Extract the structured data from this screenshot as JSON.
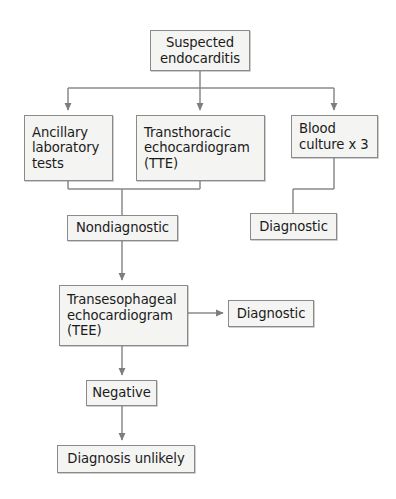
{
  "diagram": {
    "type": "flowchart",
    "background_color": "#ffffff",
    "node_fill_color": "#f4f4f2",
    "node_border_color": "#8a8a8a",
    "connector_color": "#8a8a8a",
    "text_color": "#1b1b1b",
    "nodes": [
      {
        "id": "suspected",
        "lines": [
          "Suspected",
          "endocarditis"
        ],
        "line1": "Suspected",
        "line2": "endocarditis"
      },
      {
        "id": "ancillary",
        "lines": [
          "Ancillary",
          "laboratory",
          "tests"
        ],
        "line1": "Ancillary",
        "line2": "laboratory",
        "line3": "tests"
      },
      {
        "id": "tte",
        "lines": [
          "Transthoracic",
          "echocardiogram",
          "(TTE)"
        ],
        "line1": "Transthoracic",
        "line2": "echocardiogram",
        "line3": "(TTE)"
      },
      {
        "id": "blood_culture",
        "lines": [
          "Blood",
          "culture x 3"
        ],
        "line1": "Blood",
        "line2": "culture x 3"
      },
      {
        "id": "nondiagnostic",
        "lines": [
          "Nondiagnostic"
        ],
        "line1": "Nondiagnostic"
      },
      {
        "id": "diagnostic_upper",
        "lines": [
          "Diagnostic"
        ],
        "line1": "Diagnostic"
      },
      {
        "id": "tee",
        "lines": [
          "Transesophageal",
          "echocardiogram",
          "(TEE)"
        ],
        "line1": "Transesophageal",
        "line2": "echocardiogram",
        "line3": "(TEE)"
      },
      {
        "id": "diagnostic_lower",
        "lines": [
          "Diagnostic"
        ],
        "line1": "Diagnostic"
      },
      {
        "id": "negative",
        "lines": [
          "Negative"
        ],
        "line1": "Negative"
      },
      {
        "id": "diagnosis_unlikely",
        "lines": [
          "Diagnosis unlikely"
        ],
        "line1": "Diagnosis unlikely"
      }
    ],
    "edges": [
      {
        "from": "suspected",
        "to": "ancillary",
        "style": "elbow",
        "arrow": true
      },
      {
        "from": "suspected",
        "to": "tte",
        "style": "straight",
        "arrow": true
      },
      {
        "from": "suspected",
        "to": "blood_culture",
        "style": "elbow",
        "arrow": true
      },
      {
        "from": "ancillary",
        "to": "nondiagnostic",
        "style": "elbow-merge",
        "arrow": false
      },
      {
        "from": "tte",
        "to": "nondiagnostic",
        "style": "elbow-merge",
        "arrow": false
      },
      {
        "from": "blood_culture",
        "to": "diagnostic_upper",
        "style": "elbow",
        "arrow": false
      },
      {
        "from": "nondiagnostic",
        "to": "tee",
        "style": "straight",
        "arrow": true
      },
      {
        "from": "tee",
        "to": "diagnostic_lower",
        "style": "straight-horizontal",
        "arrow": true
      },
      {
        "from": "tee",
        "to": "negative",
        "style": "straight",
        "arrow": true
      },
      {
        "from": "negative",
        "to": "diagnosis_unlikely",
        "style": "straight",
        "arrow": true
      }
    ]
  }
}
